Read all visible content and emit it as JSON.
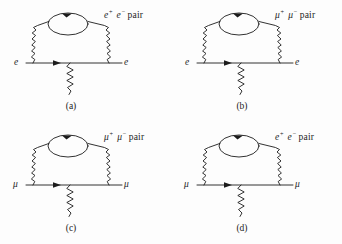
{
  "figure": {
    "type": "feynman-diagram-grid",
    "background_color": "#fdfdfd",
    "line_color": "#1c1c1c",
    "columns": 2,
    "rows": 2
  },
  "panels": [
    {
      "id": "a",
      "caption": "(a)",
      "incoming_label": "e",
      "outgoing_label": "e",
      "loop_label_particle": "e",
      "loop_label_sup_left": "+",
      "loop_label_sup_right": "−",
      "loop_label_word": "pair",
      "loop_label_full": "e+ e− pair",
      "external_line_type": "fermion",
      "loop_type": "fermion-loop",
      "photon_lines": 3
    },
    {
      "id": "b",
      "caption": "(b)",
      "incoming_label": "e",
      "outgoing_label": "e",
      "loop_label_particle": "μ",
      "loop_label_sup_left": "+",
      "loop_label_sup_right": "−",
      "loop_label_word": "pair",
      "loop_label_full": "μ+ μ− pair",
      "external_line_type": "fermion",
      "loop_type": "fermion-loop",
      "photon_lines": 3
    },
    {
      "id": "c",
      "caption": "(c)",
      "incoming_label": "μ",
      "outgoing_label": "μ",
      "loop_label_particle": "μ",
      "loop_label_sup_left": "+",
      "loop_label_sup_right": "−",
      "loop_label_word": "pair",
      "loop_label_full": "μ+ μ− pair",
      "external_line_type": "fermion",
      "loop_type": "fermion-loop",
      "photon_lines": 3
    },
    {
      "id": "d",
      "caption": "(d)",
      "incoming_label": "μ",
      "outgoing_label": "μ",
      "loop_label_particle": "e",
      "loop_label_sup_left": "+",
      "loop_label_sup_right": "−",
      "loop_label_word": "pair",
      "loop_label_full": "e+ e− pair",
      "external_line_type": "fermion",
      "loop_type": "fermion-loop",
      "photon_lines": 3
    }
  ]
}
